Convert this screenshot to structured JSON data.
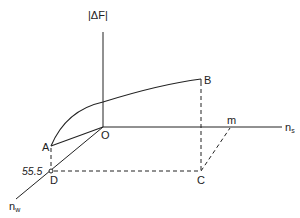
{
  "diagram": {
    "axes": {
      "vertical_label": "|ΔF|",
      "horizontal_label_base": "n",
      "horizontal_label_sub": "s",
      "depth_label_base": "n",
      "depth_label_sub": "w"
    },
    "points": {
      "origin": "O",
      "a": "A",
      "b": "B",
      "c": "C",
      "d": "D",
      "m": "m"
    },
    "annotations": {
      "d_value": "55.5"
    },
    "colors": {
      "line": "#222222",
      "background": "#ffffff"
    }
  }
}
